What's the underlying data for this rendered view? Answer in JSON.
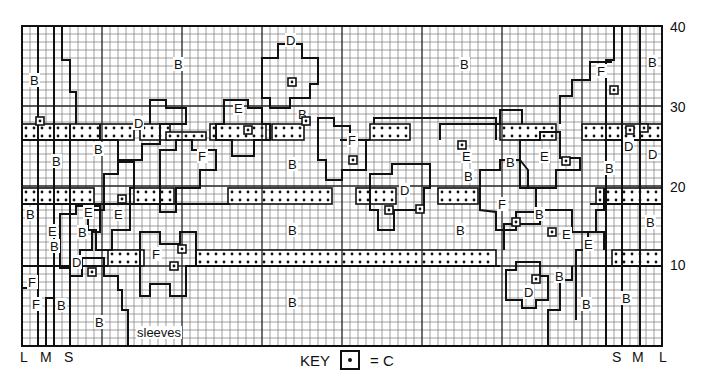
{
  "chart_title": "Knitting colour chart (body and sleeves)",
  "grid": {
    "cols": 80,
    "rows": 40,
    "cell_px": 8,
    "left": 22,
    "top": 26,
    "major_every": 10
  },
  "y_axis": {
    "labels": [
      {
        "value": "40",
        "row": 40
      },
      {
        "value": "30",
        "row": 30
      },
      {
        "value": "20",
        "row": 20
      },
      {
        "value": "10",
        "row": 10
      }
    ]
  },
  "sizes_left": [
    "L",
    "M",
    "S"
  ],
  "sizes_right": [
    "S",
    "M",
    "L"
  ],
  "sleeves_label": "sleeves",
  "key": {
    "label": "KEY",
    "symbol": "dot-in-box",
    "equals": "= C"
  },
  "region_labels": [
    {
      "t": "B",
      "x": 30,
      "y": 74
    },
    {
      "t": "B",
      "x": 174,
      "y": 58
    },
    {
      "t": "D",
      "x": 286,
      "y": 34
    },
    {
      "t": "B",
      "x": 298,
      "y": 108
    },
    {
      "t": "E",
      "x": 234,
      "y": 102
    },
    {
      "t": "D",
      "x": 134,
      "y": 117
    },
    {
      "t": "B",
      "x": 94,
      "y": 143
    },
    {
      "t": "B",
      "x": 52,
      "y": 155
    },
    {
      "t": "F",
      "x": 198,
      "y": 150
    },
    {
      "t": "B",
      "x": 288,
      "y": 158
    },
    {
      "t": "F",
      "x": 348,
      "y": 134
    },
    {
      "t": "E",
      "x": 462,
      "y": 150
    },
    {
      "t": "B",
      "x": 464,
      "y": 170
    },
    {
      "t": "B",
      "x": 460,
      "y": 58
    },
    {
      "t": "B",
      "x": 506,
      "y": 156
    },
    {
      "t": "E",
      "x": 540,
      "y": 150
    },
    {
      "t": "F",
      "x": 597,
      "y": 65
    },
    {
      "t": "B",
      "x": 648,
      "y": 56
    },
    {
      "t": "D",
      "x": 624,
      "y": 140
    },
    {
      "t": "D",
      "x": 648,
      "y": 148
    },
    {
      "t": "B",
      "x": 605,
      "y": 162
    },
    {
      "t": "D",
      "x": 400,
      "y": 184
    },
    {
      "t": "B",
      "x": 26,
      "y": 208
    },
    {
      "t": "E",
      "x": 84,
      "y": 206
    },
    {
      "t": "E",
      "x": 114,
      "y": 208
    },
    {
      "t": "E",
      "x": 48,
      "y": 225
    },
    {
      "t": "B",
      "x": 78,
      "y": 226
    },
    {
      "t": "B",
      "x": 50,
      "y": 240
    },
    {
      "t": "D",
      "x": 72,
      "y": 256
    },
    {
      "t": "B",
      "x": 288,
      "y": 224
    },
    {
      "t": "B",
      "x": 456,
      "y": 224
    },
    {
      "t": "F",
      "x": 498,
      "y": 198
    },
    {
      "t": "B",
      "x": 535,
      "y": 208
    },
    {
      "t": "E",
      "x": 562,
      "y": 228
    },
    {
      "t": "E",
      "x": 584,
      "y": 238
    },
    {
      "t": "B",
      "x": 646,
      "y": 216
    },
    {
      "t": "F",
      "x": 152,
      "y": 248
    },
    {
      "t": "F",
      "x": 28,
      "y": 276
    },
    {
      "t": "F",
      "x": 32,
      "y": 298
    },
    {
      "t": "B",
      "x": 57,
      "y": 299
    },
    {
      "t": "B",
      "x": 95,
      "y": 316
    },
    {
      "t": "B",
      "x": 288,
      "y": 296
    },
    {
      "t": "D",
      "x": 524,
      "y": 286
    },
    {
      "t": "B",
      "x": 555,
      "y": 270
    },
    {
      "t": "B",
      "x": 582,
      "y": 298
    },
    {
      "t": "B",
      "x": 622,
      "y": 292
    }
  ],
  "c_stitches": [
    [
      36,
      117
    ],
    [
      118,
      195
    ],
    [
      178,
      245
    ],
    [
      244,
      126
    ],
    [
      288,
      78
    ],
    [
      302,
      117
    ],
    [
      349,
      156
    ],
    [
      385,
      206
    ],
    [
      416,
      205
    ],
    [
      458,
      141
    ],
    [
      512,
      218
    ],
    [
      562,
      157
    ],
    [
      626,
      126
    ],
    [
      610,
      86
    ],
    [
      548,
      228
    ],
    [
      88,
      268
    ],
    [
      170,
      262
    ],
    [
      532,
      275
    ],
    [
      640,
      124
    ]
  ],
  "dotted_bands": [
    {
      "x": 22,
      "y": 124,
      "w": 112,
      "h": 16
    },
    {
      "x": 140,
      "y": 124,
      "w": 30,
      "h": 16
    },
    {
      "x": 166,
      "y": 132,
      "w": 40,
      "h": 8
    },
    {
      "x": 210,
      "y": 124,
      "w": 56,
      "h": 16
    },
    {
      "x": 272,
      "y": 124,
      "w": 32,
      "h": 16
    },
    {
      "x": 370,
      "y": 124,
      "w": 40,
      "h": 16
    },
    {
      "x": 500,
      "y": 124,
      "w": 56,
      "h": 16
    },
    {
      "x": 582,
      "y": 124,
      "w": 80,
      "h": 16
    },
    {
      "x": 22,
      "y": 188,
      "w": 72,
      "h": 16
    },
    {
      "x": 134,
      "y": 188,
      "w": 40,
      "h": 16
    },
    {
      "x": 228,
      "y": 188,
      "w": 104,
      "h": 16
    },
    {
      "x": 356,
      "y": 188,
      "w": 40,
      "h": 16
    },
    {
      "x": 438,
      "y": 188,
      "w": 40,
      "h": 16
    },
    {
      "x": 596,
      "y": 188,
      "w": 66,
      "h": 16
    },
    {
      "x": 108,
      "y": 250,
      "w": 36,
      "h": 16
    },
    {
      "x": 196,
      "y": 250,
      "w": 300,
      "h": 16
    },
    {
      "x": 612,
      "y": 250,
      "w": 50,
      "h": 16
    }
  ]
}
